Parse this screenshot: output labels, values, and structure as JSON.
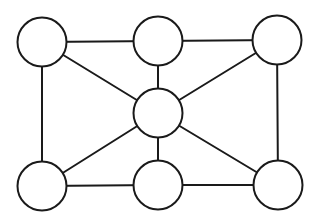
{
  "diagram": {
    "type": "undirected-graph",
    "stroke_color": "#1a1a1a",
    "background": "#ffffff",
    "node_radius": 24.5,
    "nodes": [
      {
        "id": "top-left",
        "x": 42,
        "y": 42
      },
      {
        "id": "top-middle",
        "x": 158,
        "y": 41
      },
      {
        "id": "top-right",
        "x": 277,
        "y": 40
      },
      {
        "id": "center",
        "x": 158,
        "y": 113
      },
      {
        "id": "bottom-left",
        "x": 42,
        "y": 186
      },
      {
        "id": "bottom-middle",
        "x": 158,
        "y": 185
      },
      {
        "id": "bottom-right",
        "x": 278,
        "y": 185
      }
    ],
    "edges": [
      {
        "from": "top-left",
        "to": "top-middle"
      },
      {
        "from": "top-middle",
        "to": "top-right"
      },
      {
        "from": "top-left",
        "to": "bottom-left"
      },
      {
        "from": "top-right",
        "to": "bottom-right"
      },
      {
        "from": "bottom-left",
        "to": "bottom-middle"
      },
      {
        "from": "bottom-middle",
        "to": "bottom-right"
      },
      {
        "from": "top-middle",
        "to": "center"
      },
      {
        "from": "center",
        "to": "bottom-middle"
      },
      {
        "from": "top-left",
        "to": "center"
      },
      {
        "from": "top-right",
        "to": "center"
      },
      {
        "from": "bottom-left",
        "to": "center"
      },
      {
        "from": "bottom-right",
        "to": "center"
      }
    ]
  }
}
